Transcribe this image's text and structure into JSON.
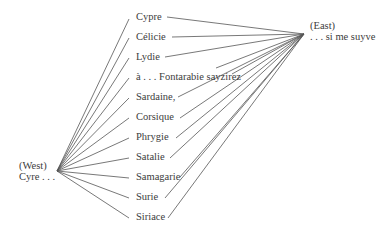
{
  "diagram": {
    "west": {
      "direction": "(West)",
      "text": "Cyre . . ."
    },
    "east": {
      "direction": "(East)",
      "text": ". . . si me suyve"
    },
    "places": [
      "Cypre",
      "Célicie",
      "Lydie",
      "à . . . Fontarabie sayzirez",
      "Sardaine,",
      "Corsique",
      "Phrygie",
      "Satalie",
      "Samagarie",
      "Surie",
      "Siriace"
    ]
  }
}
